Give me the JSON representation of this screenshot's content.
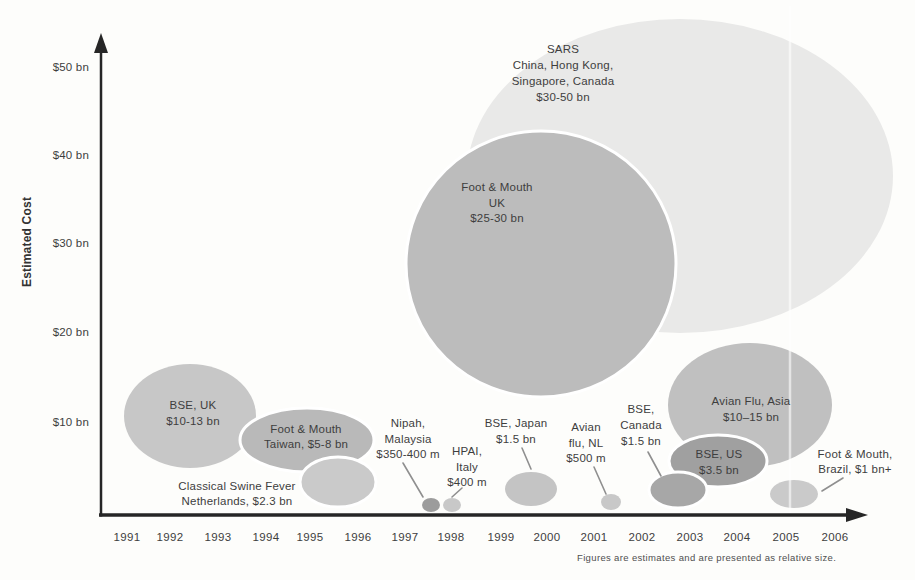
{
  "figure": {
    "background": "#fdfdfb",
    "scan_artifact_x": 790
  },
  "colors": {
    "text": "#3e3e3e",
    "axis": "#262626",
    "leader": "#8f8f8f",
    "outline": "#ffffff",
    "footnote": "#4f4f4f"
  },
  "chart_data": {
    "type": "bubble",
    "title": "",
    "xlabel": "",
    "ylabel": "Estimated Cost",
    "footnote": "Figures are estimates and are presented as relative size.",
    "x_axis": {
      "min": 1991,
      "max": 2006
    },
    "y_axis": {
      "min": 0,
      "max": 55,
      "unit": "US$ bn"
    },
    "x_ticks": [
      {
        "label": "1991",
        "x": 127
      },
      {
        "label": "1992",
        "x": 170
      },
      {
        "label": "1993",
        "x": 218
      },
      {
        "label": "1994",
        "x": 266
      },
      {
        "label": "1995",
        "x": 310
      },
      {
        "label": "1996",
        "x": 358
      },
      {
        "label": "1997",
        "x": 405
      },
      {
        "label": "1998",
        "x": 451
      },
      {
        "label": "1999",
        "x": 501
      },
      {
        "label": "2000",
        "x": 547
      },
      {
        "label": "2001",
        "x": 594
      },
      {
        "label": "2002",
        "x": 642
      },
      {
        "label": "2003",
        "x": 690
      },
      {
        "label": "2004",
        "x": 737
      },
      {
        "label": "2005",
        "x": 786
      },
      {
        "label": "2006",
        "x": 835
      }
    ],
    "y_ticks": [
      {
        "label": "$10 bn",
        "value": 10,
        "y": 426
      },
      {
        "label": "$20 bn",
        "value": 20,
        "y": 336
      },
      {
        "label": "$30 bn",
        "value": 30,
        "y": 247
      },
      {
        "label": "$40 bn",
        "value": 40,
        "y": 159
      },
      {
        "label": "$50 bn",
        "value": 50,
        "y": 71
      }
    ],
    "events": [
      {
        "id": "bse_uk",
        "disease": "BSE",
        "location": "UK",
        "cost": "$10-13 bn",
        "approx_year": 1992,
        "label_lines": [
          "BSE, UK",
          "$10-13 bn"
        ],
        "bubble": {
          "cx": 190,
          "cy": 416,
          "rx": 66,
          "ry": 52,
          "fill": "#c7c7c7",
          "white_outline": false
        },
        "label": {
          "x": 193,
          "y": 409,
          "lh": 16
        },
        "leader": null
      },
      {
        "id": "fmd_taiwan",
        "disease": "Foot & Mouth",
        "location": "Taiwan",
        "cost": "$5-8 bn",
        "approx_year": 1995,
        "label_lines": [
          "Foot & Mouth",
          "Taiwan, $5-8 bn"
        ],
        "bubble": {
          "cx": 307,
          "cy": 440,
          "rx": 67,
          "ry": 32,
          "fill": "#b9b9b9",
          "white_outline": true
        },
        "label": {
          "x": 306,
          "y": 433,
          "lh": 15
        },
        "leader": null
      },
      {
        "id": "csf_nl",
        "disease": "Classical Swine Fever",
        "location": "Netherlands",
        "cost": "$2.3 bn",
        "approx_year": 1996,
        "label_lines": [
          "Classical Swine Fever",
          "Netherlands, $2.3 bn"
        ],
        "bubble": {
          "cx": 338,
          "cy": 482,
          "rx": 38,
          "ry": 25,
          "fill": "#cacaca",
          "white_outline": true
        },
        "label": {
          "x": 237,
          "y": 490,
          "lh": 14.5
        },
        "leader": null
      },
      {
        "id": "nipah",
        "disease": "Nipah",
        "location": "Malaysia",
        "cost": "$350-400 m",
        "approx_year": 1997,
        "label_lines": [
          "Nipah,",
          "Malaysia",
          "$350-400 m"
        ],
        "bubble": {
          "cx": 431,
          "cy": 505,
          "rx": 9,
          "ry": 7,
          "fill": "#9c9c9c",
          "white_outline": false
        },
        "label": {
          "x": 408,
          "y": 427,
          "lh": 15.5
        },
        "leader": {
          "x1": 403,
          "y1": 463,
          "x2": 423,
          "y2": 497
        }
      },
      {
        "id": "hpai",
        "disease": "HPAI",
        "location": "Italy",
        "cost": "$400 m",
        "approx_year": 1998,
        "label_lines": [
          "HPAI,",
          "Italy",
          "$400 m"
        ],
        "bubble": {
          "cx": 452,
          "cy": 505,
          "rx": 9,
          "ry": 7,
          "fill": "#c8c8c8",
          "white_outline": false
        },
        "label": {
          "x": 467,
          "y": 455,
          "lh": 15.5
        },
        "leader": {
          "x1": 462,
          "y1": 488,
          "x2": 452,
          "y2": 497
        }
      },
      {
        "id": "bse_japan",
        "disease": "BSE",
        "location": "Japan",
        "cost": "$1.5 bn",
        "approx_year": 2000,
        "label_lines": [
          "BSE, Japan",
          "$1.5 bn"
        ],
        "bubble": {
          "cx": 531,
          "cy": 489,
          "rx": 26,
          "ry": 17,
          "fill": "#c4c4c4",
          "white_outline": false
        },
        "label": {
          "x": 516,
          "y": 427,
          "lh": 15.5
        },
        "leader": {
          "x1": 522,
          "y1": 448,
          "x2": 531,
          "y2": 469
        }
      },
      {
        "id": "fmd_uk",
        "disease": "Foot & Mouth",
        "location": "UK",
        "cost": "$25-30 bn",
        "approx_year": 2000,
        "label_lines": [
          "Foot & Mouth",
          "UK",
          "$25-30 bn"
        ],
        "bubble": {
          "cx": 541,
          "cy": 264,
          "rx": 135,
          "ry": 133,
          "fill": "#bcbcbc",
          "white_outline": true
        },
        "label": {
          "x": 497,
          "y": 191,
          "lh": 15.5
        },
        "leader": null
      },
      {
        "id": "avian_nl",
        "disease": "Avian flu",
        "location": "NL",
        "cost": "$500 m",
        "approx_year": 2001,
        "label_lines": [
          "Avian",
          "flu, NL",
          "$500 m"
        ],
        "bubble": {
          "cx": 611,
          "cy": 502,
          "rx": 10,
          "ry": 8,
          "fill": "#c8c8c8",
          "white_outline": false
        },
        "label": {
          "x": 586,
          "y": 431,
          "lh": 15.5
        },
        "leader": {
          "x1": 594,
          "y1": 467,
          "x2": 606,
          "y2": 494
        }
      },
      {
        "id": "sars",
        "disease": "SARS",
        "location": "China, Hong Kong, Singapore, Canada",
        "cost": "$30-50 bn",
        "approx_year": 2003,
        "label_lines": [
          "SARS",
          "China, Hong Kong,",
          "Singapore, Canada",
          "$30-50 bn"
        ],
        "bubble": {
          "cx": 680,
          "cy": 176,
          "rx": 213,
          "ry": 157,
          "fill": "#e9e9e8",
          "white_outline": false
        },
        "label": {
          "x": 563,
          "y": 53,
          "lh": 16
        },
        "leader": null
      },
      {
        "id": "bse_canada",
        "disease": "BSE",
        "location": "Canada",
        "cost": "$1.5 bn",
        "approx_year": 2003,
        "label_lines": [
          "BSE,",
          "Canada",
          "$1.5 bn"
        ],
        "bubble": {
          "cx": 678,
          "cy": 490,
          "rx": 29,
          "ry": 18,
          "fill": "#a7a7a7",
          "white_outline": true
        },
        "label": {
          "x": 641,
          "y": 413,
          "lh": 16
        },
        "leader": {
          "x1": 648,
          "y1": 452,
          "x2": 661,
          "y2": 476
        }
      },
      {
        "id": "bse_us",
        "disease": "BSE",
        "location": "US",
        "cost": "$3.5 bn",
        "approx_year": 2004,
        "label_lines": [
          "BSE, US",
          "$3.5 bn"
        ],
        "bubble": {
          "cx": 718,
          "cy": 461,
          "rx": 49,
          "ry": 26,
          "fill": "#a0a0a0",
          "white_outline": true
        },
        "label": {
          "x": 719,
          "y": 458,
          "lh": 15.5
        },
        "leader": null
      },
      {
        "id": "avian_asia",
        "disease": "Avian Flu",
        "location": "Asia",
        "cost": "$10–15 bn",
        "approx_year": 2004,
        "label_lines": [
          "Avian Flu, Asia",
          "$10–15 bn"
        ],
        "bubble": {
          "cx": 750,
          "cy": 405,
          "rx": 82,
          "ry": 62,
          "fill": "#c0c0c0",
          "white_outline": false
        },
        "label": {
          "x": 751,
          "y": 405,
          "lh": 16
        },
        "leader": null
      },
      {
        "id": "fmd_brazil",
        "disease": "Foot & Mouth",
        "location": "Brazil",
        "cost": "$1 bn+",
        "approx_year": 2005,
        "label_lines": [
          "Foot & Mouth,",
          "Brazil, $1 bn+"
        ],
        "bubble": {
          "cx": 794,
          "cy": 494,
          "rx": 24,
          "ry": 14,
          "fill": "#cacaca",
          "white_outline": false
        },
        "label": {
          "x": 855,
          "y": 458,
          "lh": 14.5
        },
        "leader": {
          "x1": 843,
          "y1": 478,
          "x2": 822,
          "y2": 491
        }
      }
    ],
    "draw_order": [
      "sars",
      "fmd_uk",
      "bse_uk",
      "fmd_taiwan",
      "csf_nl",
      "avian_asia",
      "bse_us",
      "bse_canada",
      "nipah",
      "hpai",
      "bse_japan",
      "avian_nl",
      "fmd_brazil"
    ],
    "layout": {
      "axis": {
        "x": 101,
        "y": 515,
        "x_line_end": 848,
        "x_arrow_tip": 868,
        "y_line_end": 50,
        "y_arrow_tip": 33
      },
      "x_tick_baseline_y": 541,
      "y_tick_right_x": 89,
      "label_font_px": 11.5
    }
  }
}
